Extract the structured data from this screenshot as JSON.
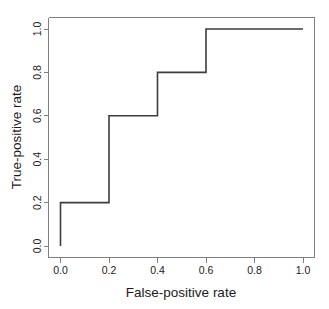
{
  "chart_data": {
    "type": "line",
    "title": "",
    "xlabel": "False-positive rate",
    "ylabel": "True-positive rate",
    "xlim": [
      0.0,
      1.0
    ],
    "ylim": [
      0.0,
      1.0
    ],
    "grid": false,
    "legend": false,
    "style": "step-post",
    "line_color": "#3c3c3c",
    "axis_color": "#808080",
    "background": "#ffffff",
    "x": [
      0.0,
      0.0,
      0.2,
      0.2,
      0.4,
      0.4,
      0.6,
      0.6,
      1.0
    ],
    "y": [
      0.0,
      0.2,
      0.2,
      0.6,
      0.6,
      0.8,
      0.8,
      1.0,
      1.0
    ],
    "series": [
      {
        "name": "ROC curve",
        "points": [
          [
            0.0,
            0.0
          ],
          [
            0.0,
            0.2
          ],
          [
            0.2,
            0.2
          ],
          [
            0.2,
            0.6
          ],
          [
            0.4,
            0.6
          ],
          [
            0.4,
            0.8
          ],
          [
            0.6,
            0.8
          ],
          [
            0.6,
            1.0
          ],
          [
            1.0,
            1.0
          ]
        ]
      }
    ],
    "xticks": [
      0.0,
      0.2,
      0.4,
      0.6,
      0.8,
      1.0
    ],
    "yticks": [
      0.0,
      0.2,
      0.4,
      0.6,
      0.8,
      1.0
    ],
    "xticklabels": [
      "0.0",
      "0.2",
      "0.4",
      "0.6",
      "0.8",
      "1.0"
    ],
    "yticklabels": [
      "0.0",
      "0.2",
      "0.4",
      "0.6",
      "0.8",
      "1.0"
    ]
  },
  "axes": {
    "x_title": "False-positive rate",
    "y_title": "True-positive rate"
  },
  "x_tick_labels": {
    "t0": "0.0",
    "t1": "0.2",
    "t2": "0.4",
    "t3": "0.6",
    "t4": "0.8",
    "t5": "1.0"
  },
  "y_tick_labels": {
    "t0": "0.0",
    "t1": "0.2",
    "t2": "0.4",
    "t3": "0.6",
    "t4": "0.8",
    "t5": "1.0"
  }
}
